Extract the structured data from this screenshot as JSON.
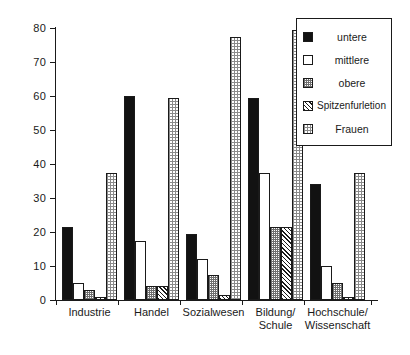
{
  "chart_data": {
    "type": "bar",
    "title": "",
    "xlabel": "",
    "ylabel": "",
    "ylim": [
      0,
      80
    ],
    "yticks": [
      0,
      10,
      20,
      30,
      40,
      50,
      60,
      70,
      80
    ],
    "grid": false,
    "legend_position": "top-right",
    "categories": [
      "Industrie",
      "Handel",
      "Sozialwesen",
      "Bildung/\nSchule",
      "Hochschule/\nWissenschaft"
    ],
    "series": [
      {
        "name": "untere",
        "key": "untere",
        "values": [
          21.5,
          60.0,
          19.5,
          59.5,
          34.0
        ]
      },
      {
        "name": "mittlere",
        "key": "mittlere",
        "values": [
          5.0,
          17.5,
          12.0,
          37.5,
          10.0
        ]
      },
      {
        "name": "obere",
        "key": "obere",
        "values": [
          3.0,
          4.0,
          7.5,
          21.5,
          5.0
        ]
      },
      {
        "name": "Spitzenfurletion",
        "key": "spitzen",
        "values": [
          1.0,
          4.0,
          1.5,
          21.5,
          1.0
        ]
      },
      {
        "name": "Frauen",
        "key": "frauen",
        "values": [
          37.5,
          59.5,
          77.5,
          79.5,
          37.5
        ]
      }
    ]
  },
  "legend": {
    "items": [
      {
        "label": "untere",
        "swatch": "solid-black-swatch"
      },
      {
        "label": "mittlere",
        "swatch": "white-swatch"
      },
      {
        "label": "obere",
        "swatch": "fine-dotted-swatch"
      },
      {
        "label": "Spitzenfurletion",
        "swatch": "diagonal-hatch-swatch"
      },
      {
        "label": "Frauen",
        "swatch": "coarse-dotted-swatch"
      }
    ]
  },
  "axis": {
    "y_tick_labels": [
      "0",
      "10",
      "20",
      "30",
      "40",
      "50",
      "60",
      "70",
      "80"
    ]
  }
}
